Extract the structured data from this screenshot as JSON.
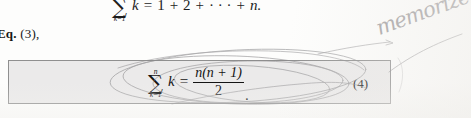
{
  "page": {
    "kind": "scanned-textbook-fragment",
    "background_color": "#fdfdfc"
  },
  "equation_top": {
    "sum_upper_limit": "n",
    "sum_symbol": "∑",
    "sum_lower_limit": "k=1",
    "summand": "k",
    "equals": "=",
    "rhs": "1 + 2 + ··· + n.",
    "term_1": "1",
    "plus_1": "+",
    "term_2": "2",
    "plus_2": "+",
    "ellipsis": "· · ·",
    "plus_3": "+",
    "term_n": "n."
  },
  "eq_reference": {
    "prefix": "Eq.",
    "number": "(3),",
    "full": "Eq. (3),"
  },
  "boxed_equation": {
    "sum_upper_limit": "n",
    "sum_symbol": "∑",
    "sum_lower_limit": "k=1",
    "summand": "k",
    "equals": "=",
    "numerator": "n(n + 1)",
    "denominator": "2",
    "period": ".",
    "equation_number": "(4)",
    "box_fill_color": "#ebeaea",
    "box_border_color": "#8f8f8f"
  },
  "annotation": {
    "handwritten_note": "memorize",
    "ink_color": "#8d8a8c",
    "marks": "hand-drawn pencil ellipses circling the boxed equation with a leader line to the note"
  }
}
